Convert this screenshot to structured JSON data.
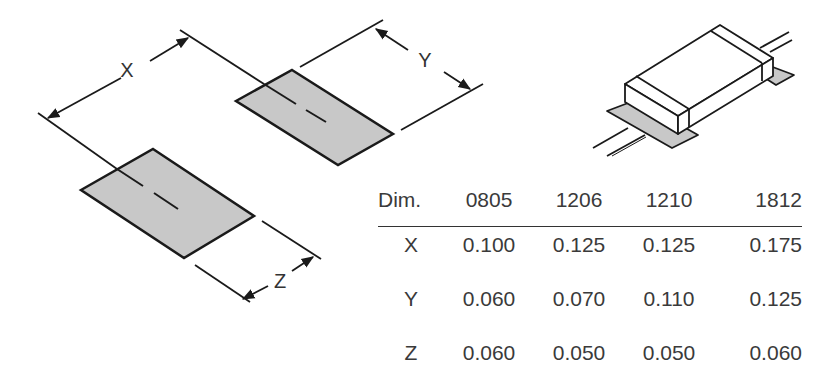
{
  "diagram": {
    "labels": {
      "x": "X",
      "y": "Y",
      "z": "Z"
    },
    "colors": {
      "pad_fill": "#c8c8c8",
      "stroke": "#1a1a1a"
    }
  },
  "table": {
    "headers": [
      "Dim.",
      "0805",
      "1206",
      "1210",
      "1812"
    ],
    "rows": [
      {
        "dim": "X",
        "values": [
          "0.100",
          "0.125",
          "0.125",
          "0.175"
        ]
      },
      {
        "dim": "Y",
        "values": [
          "0.060",
          "0.070",
          "0.110",
          "0.125"
        ]
      },
      {
        "dim": "Z",
        "values": [
          "0.060",
          "0.050",
          "0.050",
          "0.060"
        ]
      }
    ]
  }
}
